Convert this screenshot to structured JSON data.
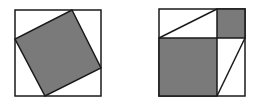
{
  "colors": {
    "background": "#ffffff",
    "fill": "#7a7a7a",
    "stroke": "#1a1a1a"
  },
  "figures": [
    {
      "name": "tilted-square-in-square",
      "outer": {
        "x": 15,
        "y": 10,
        "w": 86,
        "h": 86
      },
      "inner_points": "72,10 101,68 45,96 15,39"
    },
    {
      "name": "rearranged-squares",
      "outer": {
        "x": 159,
        "y": 9,
        "w": 86,
        "h": 87
      },
      "small_square": {
        "x": 217,
        "y": 9,
        "w": 28,
        "h": 29
      },
      "large_square": {
        "x": 159,
        "y": 38,
        "w": 58,
        "h": 58
      },
      "diagonal_top": {
        "x1": 159,
        "y1": 38,
        "x2": 217,
        "y2": 9
      },
      "diagonal_bottom": {
        "x1": 245,
        "y1": 38,
        "x2": 217,
        "y2": 96
      }
    }
  ]
}
